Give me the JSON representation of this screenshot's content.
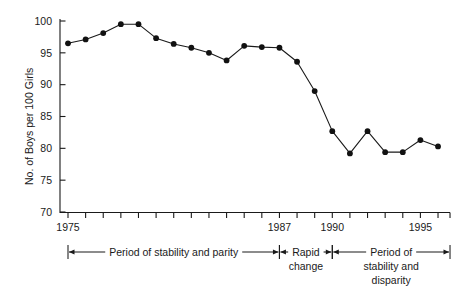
{
  "chart_data": {
    "type": "line",
    "title": "",
    "xlabel": "",
    "ylabel": "No. of Boys per 100 Girls",
    "xlim": [
      1974.5,
      1996.5
    ],
    "ylim": [
      68.5,
      100.8
    ],
    "grid": false,
    "legend": null,
    "x": [
      1975,
      1976,
      1977,
      1978,
      1979,
      1980,
      1981,
      1982,
      1983,
      1984,
      1985,
      1986,
      1987,
      1988,
      1989,
      1990,
      1991,
      1992,
      1993,
      1994,
      1995,
      1996
    ],
    "values": [
      96.5,
      97.1,
      98.1,
      99.5,
      99.5,
      97.3,
      96.4,
      95.8,
      95.0,
      93.8,
      96.1,
      95.9,
      95.8,
      93.6,
      89.0,
      82.7,
      79.2,
      82.7,
      79.4,
      79.4,
      81.3,
      80.3
    ],
    "series": [
      {
        "name": "No. of Boys per 100 Girls",
        "values": [
          96.5,
          97.1,
          98.1,
          99.5,
          99.5,
          97.3,
          96.4,
          95.8,
          95.0,
          93.8,
          96.1,
          95.9,
          95.8,
          93.6,
          89.0,
          82.7,
          79.2,
          82.7,
          79.4,
          79.4,
          81.3,
          80.3
        ]
      }
    ],
    "y_ticks": [
      70,
      75,
      80,
      85,
      90,
      95,
      100
    ],
    "y_tick_labels": [
      "70",
      "75",
      "80",
      "85",
      "90",
      "95",
      "100"
    ],
    "x_ticks": [
      1975,
      1976,
      1977,
      1978,
      1979,
      1980,
      1981,
      1982,
      1983,
      1984,
      1985,
      1986,
      1987,
      1988,
      1989,
      1990,
      1991,
      1992,
      1993,
      1994,
      1995,
      1996
    ],
    "x_tick_labels_shown": [
      {
        "value": 1975,
        "label": "1975"
      },
      {
        "value": 1987,
        "label": "1987"
      },
      {
        "value": 1990,
        "label": "1990"
      },
      {
        "value": 1995,
        "label": "1995"
      }
    ],
    "annotations": [
      {
        "id": "period-stability-parity",
        "label": "Period of stability and parity",
        "from": 1975,
        "to": 1987,
        "lines": [
          "Period of stability and parity"
        ]
      },
      {
        "id": "rapid-change",
        "label": "Rapid change",
        "from": 1987,
        "to": 1990,
        "lines": [
          "Rapid",
          "change"
        ]
      },
      {
        "id": "period-stability-disparity",
        "label": "Period of stability and disparity",
        "from": 1990,
        "to": 1996,
        "lines": [
          "Period of",
          "stability and",
          "disparity"
        ]
      }
    ],
    "colors": {
      "line": "#111111",
      "marker": "#111111",
      "axis": "#1a1a1a",
      "background": "#ffffff",
      "text": "#1a1a1a"
    }
  }
}
